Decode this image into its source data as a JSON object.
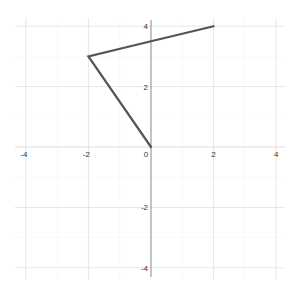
{
  "chart_data": {
    "type": "line",
    "title": "",
    "xlabel": "",
    "ylabel": "",
    "xlim": [
      -4.2,
      4.2
    ],
    "ylim": [
      -4.3,
      4.3
    ],
    "grid": true,
    "x_ticks": [
      -4,
      -2,
      0,
      2,
      4
    ],
    "y_ticks": [
      -4,
      -2,
      2,
      4
    ],
    "x_tick_labels": [
      "-4",
      "-2",
      "0",
      "2",
      "4"
    ],
    "y_tick_labels": [
      "-4",
      "-2",
      "2",
      "4"
    ],
    "series": [
      {
        "name": "path",
        "color": "#555555",
        "x": [
          0,
          -2,
          0,
          2
        ],
        "y": [
          0,
          3,
          3.5,
          4
        ]
      }
    ]
  },
  "colors": {
    "axis": "#888888",
    "grid": "#eeeeee",
    "line": "#555555"
  }
}
